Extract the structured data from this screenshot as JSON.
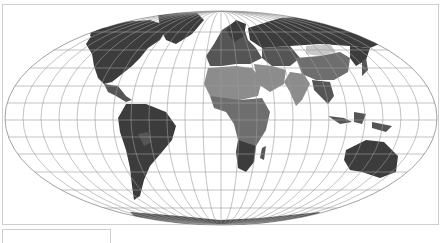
{
  "map": {
    "projection": "mollweide-like elliptical world projection",
    "style": "grayscale choropleth",
    "colors": {
      "background": "#ffffff",
      "ocean": "#ffffff",
      "graticule": "#9a9a9a",
      "outline": "#7a7a7a",
      "frame_border": "#cfcfcf",
      "shade_darkest": "#3c3c3c",
      "shade_dark": "#555555",
      "shade_mid": "#6e6e6e",
      "shade_light": "#8c8c8c",
      "shade_lightest": "#c8c8c8"
    },
    "graticule": {
      "meridian_count": 24,
      "parallel_count": 11
    },
    "regions": [
      {
        "name": "north-america",
        "shade": "shade_darkest"
      },
      {
        "name": "greenland",
        "shade": "shade_darkest"
      },
      {
        "name": "central-america",
        "shade": "shade_dark"
      },
      {
        "name": "south-america",
        "shade": "shade_darkest"
      },
      {
        "name": "europe",
        "shade": "shade_dark"
      },
      {
        "name": "russia",
        "shade": "shade_darkest"
      },
      {
        "name": "mongolia",
        "shade": "shade_lightest"
      },
      {
        "name": "china",
        "shade": "shade_mid"
      },
      {
        "name": "middle-east",
        "shade": "shade_light"
      },
      {
        "name": "india",
        "shade": "shade_light"
      },
      {
        "name": "north-africa",
        "shade": "shade_light"
      },
      {
        "name": "sub-saharan-africa",
        "shade": "shade_mid"
      },
      {
        "name": "southern-africa",
        "shade": "shade_darkest"
      },
      {
        "name": "southeast-asia",
        "shade": "shade_dark"
      },
      {
        "name": "australia",
        "shade": "shade_darkest"
      },
      {
        "name": "antarctica",
        "shade": "shade_dark"
      }
    ]
  },
  "legend": {
    "visible_text": ""
  }
}
